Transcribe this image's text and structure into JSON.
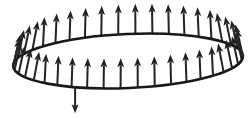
{
  "figure": {
    "title": "Flux through a circular loop",
    "background_color": "#ffffff",
    "line_color": "#18181a",
    "vector_color": "#232326"
  },
  "loop": {
    "name": "circular-loop-ellipse",
    "center_x": 128,
    "center_y": 61,
    "radius_x": 115,
    "radius_y": 27,
    "stroke_width": 2.6,
    "rotation_deg": -2.5
  },
  "chart_data": {
    "type": "scatter",
    "title": "Flux through a circular loop",
    "xlabel": "",
    "ylabel": "",
    "grid": false,
    "legend": null,
    "annotations": [
      "upward field vectors distributed around loop perimeter",
      "single downward vector at lower-left of loop"
    ],
    "series": [
      {
        "name": "upward-vectors",
        "direction": "up",
        "count": 42,
        "angles_deg": [
          0,
          8.57,
          17.14,
          25.71,
          34.29,
          42.86,
          51.43,
          60,
          68.57,
          77.14,
          85.71,
          94.29,
          102.86,
          111.43,
          120,
          128.57,
          137.14,
          145.71,
          154.29,
          162.86,
          171.43,
          180,
          188.57,
          197.14,
          205.71,
          214.29,
          222.86,
          231.43,
          240,
          248.57,
          257.14,
          265.71,
          274.29,
          282.86,
          291.43,
          300,
          308.57,
          317.14,
          325.71,
          334.29,
          342.86,
          351.43
        ],
        "length_px": 30
      },
      {
        "name": "downward-vector",
        "direction": "down",
        "count": 1,
        "angles_deg": [
          118
        ],
        "length_px": 26
      }
    ]
  },
  "vectors": {
    "up_label": "field-vector-up",
    "down_label": "field-vector-down",
    "shaft_width": 2.0,
    "head_width": 7.0,
    "head_length": 9.0,
    "up_length": 30,
    "down_length": 26,
    "count_up": 42,
    "count_down": 1,
    "tilt_max_deg": 13
  }
}
